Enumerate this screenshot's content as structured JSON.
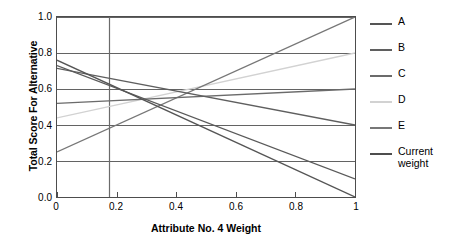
{
  "chart_data": {
    "type": "line",
    "title": "",
    "xlabel": "Attribute No. 4 Weight",
    "ylabel": "Total Score For Alternative",
    "xlim": [
      0,
      1
    ],
    "ylim": [
      0,
      1
    ],
    "xticks": [
      "0",
      "0.2",
      "0.4",
      "0.6",
      "0.8",
      "1"
    ],
    "xtick_values": [
      0,
      0.2,
      0.4,
      0.6,
      0.8,
      1
    ],
    "yticks": [
      "0.0",
      "0.2",
      "0.4",
      "0.6",
      "0.8",
      "1.0"
    ],
    "ytick_values": [
      0,
      0.2,
      0.4,
      0.6,
      0.8,
      1
    ],
    "grid": "horizontal",
    "legend_position": "right",
    "x": [
      0,
      1
    ],
    "series": [
      {
        "name": "A",
        "values": [
          0.76,
          0.0
        ],
        "color": "#555555"
      },
      {
        "name": "B",
        "values": [
          0.715,
          0.4
        ],
        "color": "#5f5f5f"
      },
      {
        "name": "C",
        "values": [
          0.52,
          0.6
        ],
        "color": "#6b6b6b"
      },
      {
        "name": "D",
        "values": [
          0.44,
          0.8
        ],
        "color": "#d2d2d2"
      },
      {
        "name": "E",
        "values": [
          0.25,
          1.0
        ],
        "color": "#777777"
      },
      {
        "name": "F",
        "values": [
          0.73,
          0.1
        ],
        "color": "#5a5a5a"
      }
    ],
    "marker_line": {
      "name": "Current weight",
      "x": 0.175,
      "color": "#6b6b6b",
      "orientation": "vertical"
    },
    "legend": [
      {
        "label": "A",
        "color": "#555555"
      },
      {
        "label": "B",
        "color": "#5f5f5f"
      },
      {
        "label": "C",
        "color": "#6b6b6b"
      },
      {
        "label": "D",
        "color": "#d2d2d2"
      },
      {
        "label": "E",
        "color": "#777777"
      },
      {
        "label": "Current\nweight",
        "color": "#4d4d4d"
      }
    ]
  },
  "axes": {
    "ylabel": "Total Score For Alternative",
    "xlabel": "Attribute No. 4 Weight",
    "yticks": [
      "1.0",
      "0.8",
      "0.6",
      "0.4",
      "0.2",
      "0.0"
    ],
    "xticks": [
      "0",
      "0.2",
      "0.4",
      "0.6",
      "0.8",
      "1"
    ]
  },
  "legend": {
    "items": [
      {
        "label": "A"
      },
      {
        "label": "B"
      },
      {
        "label": "C"
      },
      {
        "label": "D"
      },
      {
        "label": "E"
      },
      {
        "label": "Current weight"
      }
    ]
  }
}
